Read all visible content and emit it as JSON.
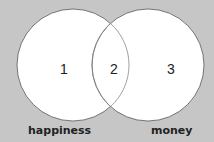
{
  "diagram": {
    "type": "venn",
    "background_color": "#c6c6c6",
    "circles": [
      {
        "name": "happiness",
        "label": "happiness"
      },
      {
        "name": "money",
        "label": "money"
      }
    ],
    "regions": {
      "left_only": "1",
      "intersection": "2",
      "right_only": "3"
    }
  }
}
